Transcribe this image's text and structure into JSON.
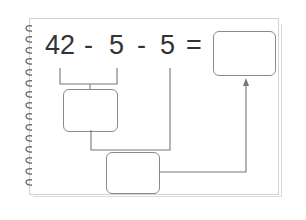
{
  "equation": {
    "operand1": "42",
    "op1": "-",
    "operand2": "5",
    "op2": "-",
    "operand3": "5",
    "equals": "="
  },
  "boxes": {
    "step1_result": "",
    "step2_result": "",
    "final_answer": ""
  },
  "colors": {
    "text": "#333333",
    "lines": "#777777",
    "box_border": "#8a8a8a",
    "page_border": "#d2d2d2"
  }
}
